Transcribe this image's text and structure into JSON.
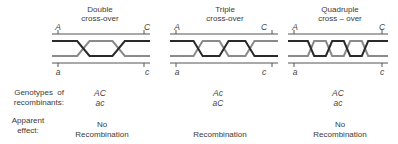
{
  "panels": [
    {
      "title_line1": "Double",
      "title_line2": "cross-over",
      "crossovers": 2,
      "gene_left_top": "A",
      "gene_right_top": "C",
      "gene_left_bottom": "a",
      "gene_right_bottom": "c",
      "genotype_1": "AC",
      "genotype_2": "ac",
      "effect_line1": "No",
      "effect_line2": "Recombination"
    },
    {
      "title_line1": "Triple",
      "title_line2": "cross-over",
      "crossovers": 3,
      "gene_left_top": "A",
      "gene_right_top": "C",
      "gene_left_bottom": "a",
      "gene_right_bottom": "c",
      "genotype_1": "Ac",
      "genotype_2": "aC",
      "effect_line1": "",
      "effect_line2": "Recombination"
    },
    {
      "title_line1": "Quadruple",
      "title_line2": "cross – over",
      "crossovers": 4,
      "gene_left_top": "A",
      "gene_right_top": "C",
      "gene_left_bottom": "a",
      "gene_right_bottom": "c",
      "genotype_1": "AC",
      "genotype_2": "ac",
      "effect_line1": "No",
      "effect_line2": "Recombination"
    }
  ],
  "row_labels": {
    "genotypes_line1": "Genotypes  of",
    "genotypes_line2": "recombinants:",
    "effect_line1": "Apparent",
    "effect_line2": "effect:"
  },
  "colors": {
    "dark_strand": "#2a2a2a",
    "light_strand": "#8a8a8a",
    "outer_line": "#555555"
  }
}
